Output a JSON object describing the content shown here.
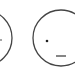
{
  "faces": [
    {
      "name": "left-face",
      "cx": -16,
      "cy": 38,
      "r": 28,
      "stroke": "#444444",
      "eye": {
        "cx": 1,
        "cy": 40
      }
    },
    {
      "name": "right-face",
      "cx": 61,
      "cy": 38,
      "r": 28,
      "stroke": "#444444",
      "eye": {
        "cx": 47,
        "cy": 41
      },
      "mouth": {
        "x1": 56,
        "x2": 66,
        "y": 56
      }
    }
  ],
  "colors": {
    "background": "#ffffff",
    "line": "#444444"
  }
}
